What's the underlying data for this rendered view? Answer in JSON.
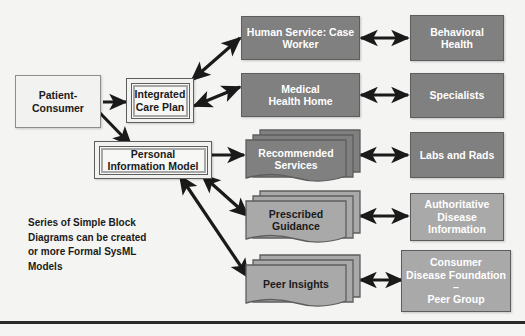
{
  "diagram": {
    "background_color": "#f4f4f2",
    "colors": {
      "gray_dark": "#808080",
      "gray_light": "#a9a9a9",
      "box_white": "#f2f2f0",
      "border": "#5d5d5d",
      "arrow": "#1a1a1a",
      "text_dark": "#1b1b1b",
      "text_light": "#ffffff"
    },
    "note": "Series of Simple Block\nDiagrams can be created\nor more Formal SysML\nModels",
    "left_column": [
      {
        "id": "patient-consumer",
        "label": "Patient-\nConsumer",
        "style": "white"
      },
      {
        "id": "integrated-care-plan",
        "label": "Integrated\nCare Plan",
        "style": "framed"
      },
      {
        "id": "personal-information-model",
        "label": "Personal\nInformation Model",
        "style": "framed"
      }
    ],
    "middle_column": [
      {
        "id": "human-service-case-worker",
        "label": "Human Service: Case\nWorker",
        "style": "gray-dark"
      },
      {
        "id": "medical-health-home",
        "label": "Medical\nHealth Home",
        "style": "gray-dark"
      },
      {
        "id": "recommended-services",
        "label": "Recommended\nServices",
        "style": "doc-stack-dark"
      },
      {
        "id": "prescribed-guidance",
        "label": "Prescribed\nGuidance",
        "style": "doc-stack-light"
      },
      {
        "id": "peer-insights",
        "label": "Peer Insights",
        "style": "doc-stack-light"
      }
    ],
    "right_column": [
      {
        "id": "behavioral-health",
        "label": "Behavioral\nHealth",
        "style": "gray-dark"
      },
      {
        "id": "specialists",
        "label": "Specialists",
        "style": "gray-dark"
      },
      {
        "id": "labs-and-rads",
        "label": "Labs and Rads",
        "style": "gray-dark"
      },
      {
        "id": "authoritative-disease-information",
        "label": "Authoritative\nDisease\nInformation",
        "style": "gray-light"
      },
      {
        "id": "consumer-disease-foundation-peer-group",
        "label": "Consumer\nDisease Foundation –\nPeer Group",
        "style": "gray-light"
      }
    ],
    "connectors": [
      {
        "from": "patient-consumer",
        "to": "integrated-care-plan",
        "heads": "single"
      },
      {
        "from": "patient-consumer",
        "to": "personal-information-model",
        "heads": "single"
      },
      {
        "from": "integrated-care-plan",
        "to": "human-service-case-worker",
        "heads": "double"
      },
      {
        "from": "integrated-care-plan",
        "to": "medical-health-home",
        "heads": "double"
      },
      {
        "from": "personal-information-model",
        "to": "recommended-services",
        "heads": "single"
      },
      {
        "from": "personal-information-model",
        "to": "prescribed-guidance",
        "heads": "double"
      },
      {
        "from": "personal-information-model",
        "to": "peer-insights",
        "heads": "double"
      },
      {
        "from": "human-service-case-worker",
        "to": "behavioral-health",
        "heads": "double"
      },
      {
        "from": "medical-health-home",
        "to": "specialists",
        "heads": "double"
      },
      {
        "from": "recommended-services",
        "to": "labs-and-rads",
        "heads": "double"
      },
      {
        "from": "prescribed-guidance",
        "to": "authoritative-disease-information",
        "heads": "double"
      },
      {
        "from": "peer-insights",
        "to": "consumer-disease-foundation-peer-group",
        "heads": "double"
      }
    ]
  }
}
